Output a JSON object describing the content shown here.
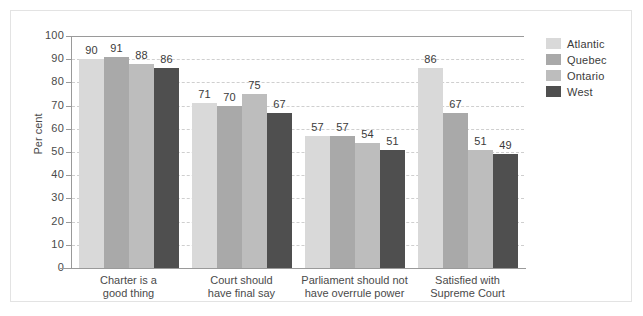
{
  "chart_data": {
    "type": "bar",
    "title": "",
    "xlabel": "",
    "ylabel": "Per cent",
    "ylim": [
      0,
      100
    ],
    "ytick_step": 10,
    "yticks": [
      100,
      90,
      80,
      70,
      60,
      50,
      40,
      30,
      20,
      10,
      0
    ],
    "grid": true,
    "legend_position": "right",
    "categories": [
      "Charter is a\ngood thing",
      "Court should\nhave final say",
      "Parliament should not\nhave overrule power",
      "Satisfied with\nSupreme Court"
    ],
    "series": [
      {
        "name": "Atlantic",
        "color": "#d9d9d9",
        "values": [
          90,
          71,
          57,
          86
        ]
      },
      {
        "name": "Quebec",
        "color": "#a9a9a9",
        "values": [
          91,
          70,
          57,
          67
        ]
      },
      {
        "name": "Ontario",
        "color": "#bdbdbd",
        "values": [
          88,
          75,
          54,
          51
        ]
      },
      {
        "name": "West",
        "color": "#4f4f4f",
        "values": [
          86,
          67,
          51,
          49
        ]
      }
    ]
  },
  "colors": {
    "background": "#ffffff",
    "frame": "#e3e3e3",
    "axis": "#9a9a9a",
    "gridline": "#cfcfcf",
    "text": "#3b3b3b"
  }
}
